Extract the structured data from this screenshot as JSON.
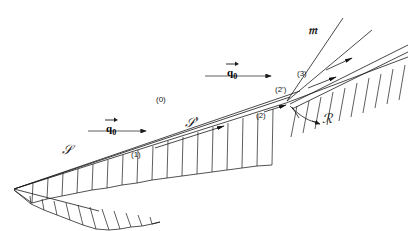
{
  "figure": {
    "type": "technical-line-diagram",
    "background_color": "#ffffff",
    "line_color": "#1a1a1a",
    "width": 408,
    "height": 231
  },
  "labels": {
    "region_0": "(0)",
    "region_1": "(1)",
    "region_2": "(2)",
    "region_2_prime": "(2')",
    "region_3": "(3)",
    "shock_S": "𝒮",
    "shock_S_prime": "𝒮'",
    "mach_stem": "𝔪",
    "reflected_shock": "ℛ",
    "q_symbol": "q",
    "q_subscript": "0"
  },
  "vectors": {
    "lower_freestream": {
      "label": "q",
      "subscript": "0"
    },
    "upper_freestream": {
      "label": "q",
      "subscript": "0"
    }
  },
  "geometry": {
    "wedge_apex": [
      14,
      189
    ],
    "upper_wedge_line": [
      [
        14,
        189
      ],
      [
        405,
        43
      ]
    ],
    "lower_wedge_line": [
      [
        14,
        189
      ],
      [
        98,
        210
      ]
    ],
    "shock_S_line": [
      [
        14,
        189
      ],
      [
        286,
        103
      ]
    ],
    "triple_point": [
      286,
      103
    ],
    "mach_stem_line": [
      [
        286,
        103
      ],
      [
        338,
        20
      ]
    ],
    "reflected_shock_line": [
      [
        286,
        103
      ],
      [
        318,
        120
      ]
    ],
    "hatched_surfaces": [
      "wedge-upper",
      "wedge-lower",
      "downstream-wall"
    ]
  }
}
